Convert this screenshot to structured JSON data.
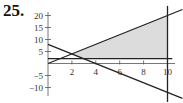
{
  "problem": {
    "number": "25."
  },
  "chart_data": {
    "type": "line",
    "title": "",
    "xlabel": "",
    "ylabel": "",
    "xlim": [
      0,
      11.2
    ],
    "ylim": [
      -14,
      22
    ],
    "grid": false,
    "x_ticks": [
      2,
      4,
      6,
      8,
      10
    ],
    "x_tick_labels": [
      "2",
      "4",
      "6",
      "8",
      "10"
    ],
    "y_ticks": [
      20,
      15,
      10,
      5,
      -5,
      -10
    ],
    "y_tick_labels": [
      "20",
      "15",
      "10",
      "5",
      "−5",
      "−10"
    ],
    "series": [
      {
        "name": "y = 2x",
        "points": [
          [
            0,
            0
          ],
          [
            11.25,
            22.5
          ]
        ]
      },
      {
        "name": "y = 8 - 2x",
        "points": [
          [
            0,
            8
          ],
          [
            11.25,
            -14.5
          ]
        ]
      },
      {
        "name": "y = 2",
        "points": [
          [
            0,
            2
          ],
          [
            10.4,
            2
          ]
        ]
      },
      {
        "name": "x = 10",
        "points": [
          [
            10,
            24
          ],
          [
            10,
            -16
          ]
        ]
      }
    ],
    "shaded_region": {
      "color": "#d9d9d9",
      "vertices": [
        [
          2,
          4
        ],
        [
          3,
          2
        ],
        [
          10,
          2
        ],
        [
          10,
          20
        ]
      ]
    },
    "colors": {
      "line": "#222222",
      "axis": "#555555",
      "shade": "#dcdcdc"
    }
  }
}
